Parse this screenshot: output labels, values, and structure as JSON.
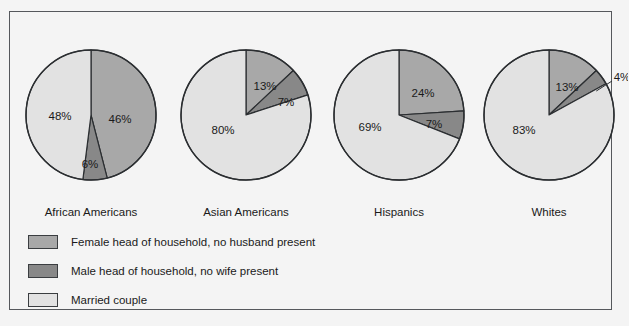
{
  "chart_data": {
    "type": "pie",
    "title": "",
    "xlabel": "",
    "ylabel": "",
    "legend_position": "bottom-left",
    "grid": false,
    "categories": [
      "Female head of household, no husband present",
      "Male head of household, no wife present",
      "Married couple"
    ],
    "series": [
      {
        "name": "African Americans",
        "values": [
          46,
          6,
          48
        ],
        "labels": [
          "46%",
          "6%",
          "48%"
        ]
      },
      {
        "name": "Asian Americans",
        "values": [
          13,
          7,
          80
        ],
        "labels": [
          "13%",
          "7%",
          "80%"
        ]
      },
      {
        "name": "Hispanics",
        "values": [
          24,
          7,
          69
        ],
        "labels": [
          "24%",
          "7%",
          "69%"
        ]
      },
      {
        "name": "Whites",
        "values": [
          13,
          4,
          83
        ],
        "labels": [
          "13%",
          "4%",
          "83%"
        ]
      }
    ],
    "colors": {
      "female_head": "#a8a8a8",
      "male_head": "#888888",
      "married_couple": "#e2e2e2",
      "outline": "#2b2e31",
      "background": "#f4f4f4",
      "text": "#1a1a1a"
    }
  },
  "pies": [
    {
      "name": "African Americans",
      "category_label": "African Americans",
      "slices": [
        {
          "key": "female_head",
          "value": 46,
          "label": "46%",
          "color": "#a8a8a8",
          "lx": 29,
          "ly": 5
        },
        {
          "key": "male_head",
          "value": 6,
          "label": "6%",
          "color": "#888888",
          "lx": -1,
          "ly": 50
        },
        {
          "key": "married_couple",
          "value": 48,
          "label": "48%",
          "color": "#e2e2e2",
          "lx": -31,
          "ly": 2
        }
      ]
    },
    {
      "name": "Asian Americans",
      "category_label": "Asian Americans",
      "slices": [
        {
          "key": "female_head",
          "value": 13,
          "label": "13%",
          "color": "#a8a8a8",
          "lx": 19,
          "ly": -28
        },
        {
          "key": "male_head",
          "value": 7,
          "label": "7%",
          "color": "#888888",
          "lx": 40,
          "ly": -12
        },
        {
          "key": "married_couple",
          "value": 80,
          "label": "80%",
          "color": "#e2e2e2",
          "lx": -23,
          "ly": 16
        }
      ]
    },
    {
      "name": "Hispanics",
      "category_label": "Hispanics",
      "slices": [
        {
          "key": "female_head",
          "value": 24,
          "label": "24%",
          "color": "#a8a8a8",
          "lx": 24,
          "ly": -21
        },
        {
          "key": "male_head",
          "value": 7,
          "label": "7%",
          "color": "#888888",
          "lx": 35,
          "ly": 10
        },
        {
          "key": "married_couple",
          "value": 69,
          "label": "69%",
          "color": "#e2e2e2",
          "lx": -29,
          "ly": 13
        }
      ]
    },
    {
      "name": "Whites",
      "category_label": "Whites",
      "slices": [
        {
          "key": "female_head",
          "value": 13,
          "label": "13%",
          "color": "#a8a8a8",
          "lx": 18,
          "ly": -27
        },
        {
          "key": "male_head",
          "value": 4,
          "label": "4%",
          "color": "#888888",
          "lx": 73,
          "ly": -37
        },
        {
          "key": "married_couple",
          "value": 83,
          "label": "83%",
          "color": "#e2e2e2",
          "lx": -25,
          "ly": 16
        }
      ]
    }
  ],
  "legend": {
    "items": [
      {
        "label": "Female head of household, no husband present",
        "color": "#a8a8a8"
      },
      {
        "label": "Male head of household, no wife present",
        "color": "#888888"
      },
      {
        "label": "Married couple",
        "color": "#e2e2e2"
      }
    ]
  },
  "geometry": {
    "radius": 65,
    "centers_x": [
      90,
      245,
      398,
      548
    ],
    "center_y": 114,
    "label_y": 205
  }
}
